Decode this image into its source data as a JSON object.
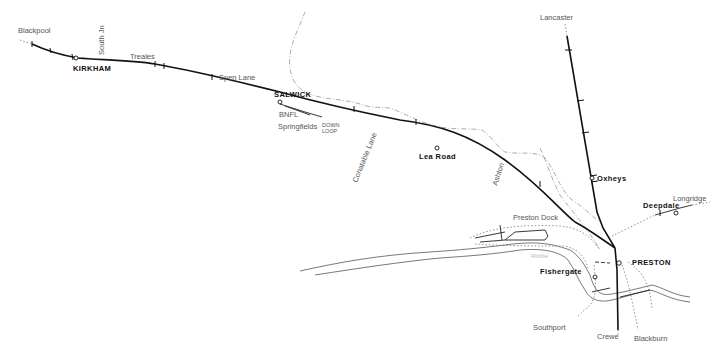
{
  "map": {
    "title": "Preston - Blackpool railway line",
    "stations": [
      {
        "name": "KIRKHAM",
        "style": "bold"
      },
      {
        "name": "SALWICK",
        "style": "bold"
      },
      {
        "name": "Lea Road",
        "style": "bold"
      },
      {
        "name": "Oxheys",
        "style": "bold"
      },
      {
        "name": "Deepdale",
        "style": "bold"
      },
      {
        "name": "PRESTON",
        "style": "bold"
      },
      {
        "name": "Fishergate",
        "style": "bold"
      }
    ],
    "destinations": {
      "blackpool": "Blackpool",
      "lancaster": "Lancaster",
      "longridge": "Longridge",
      "southport": "Southport",
      "crewe": "Crewe",
      "blackburn": "Blackburn"
    },
    "locations": {
      "south_jn": "South Jn",
      "treales": "Treales",
      "spen_lane": "Spen Lane",
      "bnfl": "BNFL",
      "springfields": "Springfields",
      "down_loop_1": "DOWN",
      "down_loop_2": "LOOP",
      "conatable_lane": "Conatable Lane",
      "ashton": "Ashton",
      "preston_dock": "Preston Dock",
      "river": "Ribble"
    }
  }
}
